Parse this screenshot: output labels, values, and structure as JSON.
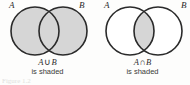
{
  "figure": {
    "type": "venn-diagram-pair",
    "background_color": "#fdfdfc",
    "stroke_color": "#2a2a2a",
    "shade_color": "#d6d6d6",
    "unshaded_color": "#ffffff",
    "caption_partial": "Figure   1.2"
  },
  "panels": [
    {
      "id": "union",
      "label_a": "A",
      "label_b": "B",
      "expression": {
        "left_set": "A",
        "operator": "∪",
        "right_set": "B",
        "full": "A ∪ B"
      },
      "caption_line2": "is shaded",
      "shaded_region": "union",
      "circle_a_filled": true,
      "circle_b_filled": true,
      "intersection_filled": true
    },
    {
      "id": "intersection",
      "label_a": "A",
      "label_b": "B",
      "expression": {
        "left_set": "A",
        "operator": "∩",
        "right_set": "B",
        "full": "A ∩ B"
      },
      "caption_line2": "is shaded",
      "shaded_region": "intersection",
      "circle_a_filled": false,
      "circle_b_filled": false,
      "intersection_filled": true
    }
  ]
}
